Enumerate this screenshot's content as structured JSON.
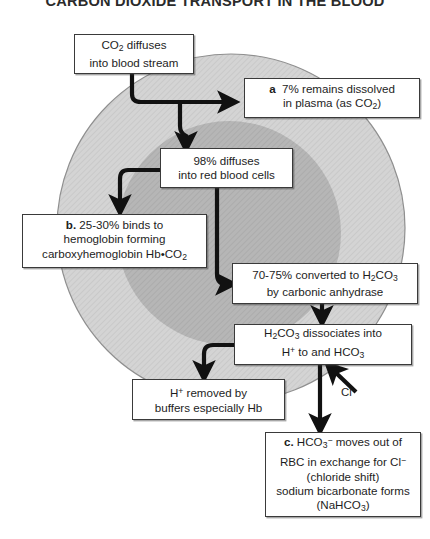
{
  "figure": {
    "title": "CARBON DIOXIDE TRANSPORT IN THE BLOOD",
    "colors": {
      "plasma_fill": "#d2d2d2",
      "rbc_fill": "#b4b4b4",
      "outline": "#8c8c8c",
      "box_fill": "#ffffff",
      "box_border": "#3a3a3a",
      "arrow": "#111111",
      "text": "#1d1d1d"
    }
  },
  "regions": {
    "plasma": {
      "name": "plasma",
      "shape": "circle"
    },
    "red_blood_cell": {
      "name": "red blood cell",
      "shape": "circle"
    }
  },
  "nodes": {
    "co2_diffuses": {
      "id": "a0",
      "lines": [
        "CO2 diffuses",
        "into blood stream"
      ],
      "line1_pre": "CO",
      "line1_sub": "2",
      "line1_post": " diffuses",
      "line2": "into blood stream"
    },
    "plasma_dissolved": {
      "id": "a",
      "marker": "a",
      "line1": "7% remains dissolved",
      "line2_pre": "in plasma (as CO",
      "line2_sub": "2",
      "line2_post": ")"
    },
    "diffuses_98": {
      "line1": "98% diffuses",
      "line2": "into red blood cells"
    },
    "hemoglobin": {
      "marker": "b.",
      "line1_post": " 25-30% binds to",
      "line2": "hemoglobin forming",
      "line3_pre": "carboxyhemoglobin Hb•CO",
      "line3_sub": "2"
    },
    "converted": {
      "line1_pre": "70-75% converted to H",
      "line1_sub1": "2",
      "line1_mid": "CO",
      "line1_sub2": "3",
      "line2": "by carbonic anhydrase"
    },
    "dissociates": {
      "line1_pre": "H",
      "line1_sub1": "2",
      "line1_mid": "CO",
      "line1_sub2": "3",
      "line1_post": " dissociates into",
      "line2_pre": "H",
      "line2_sup": "+",
      "line2_mid": " to and HCO",
      "line2_sub": "3"
    },
    "hplus_removed": {
      "line1_pre": "H",
      "line1_sup": "+",
      "line1_post": " removed by",
      "line2": "buffers especially Hb"
    },
    "bicarbonate": {
      "marker": "c.",
      "line1_pre": " HCO",
      "line1_sub": "3",
      "line1_sup": "−",
      "line1_post": " moves out of",
      "line2_pre": "RBC in exchange for Cl",
      "line2_sup": "−",
      "line3": "(chloride shift)",
      "line4": "sodium bicarbonate forms",
      "line5_pre": "(NaHCO",
      "line5_sub": "3",
      "line5_post": ")"
    }
  },
  "edge_labels": {
    "chloride": {
      "text_pre": "Cl",
      "text_sup": "−"
    }
  }
}
